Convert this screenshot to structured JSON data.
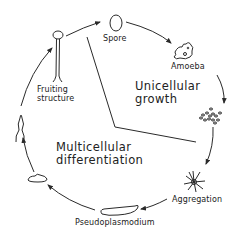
{
  "stages": [
    {
      "id": "spore",
      "label": "Spore"
    },
    {
      "id": "amoeba",
      "label": "Amoeba"
    },
    {
      "id": "aggregating-cells",
      "label": ""
    },
    {
      "id": "aggregation",
      "label": "Aggregation"
    },
    {
      "id": "pseudoplasmodium",
      "label": "Pseudoplasmodium"
    },
    {
      "id": "mound",
      "label": ""
    },
    {
      "id": "culminant",
      "label": ""
    },
    {
      "id": "fruiting-structure",
      "label_line1": "Fruiting",
      "label_line2": "structure"
    }
  ],
  "regions": {
    "unicellular": {
      "line1": "Unicellular",
      "line2": "growth"
    },
    "multicellular": {
      "line1": "Multicellular",
      "line2": "differentiation"
    }
  },
  "colors": {
    "ink": "#2a2a2a",
    "background": "#ffffff"
  }
}
